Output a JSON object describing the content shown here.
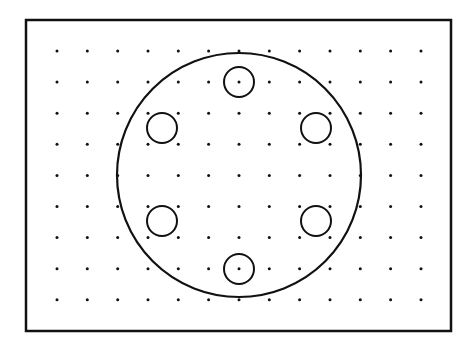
{
  "diagram": {
    "type": "bolt-circle-on-dot-grid",
    "frame": {
      "x": 26,
      "y": 20,
      "width": 425,
      "height": 311,
      "stroke": "#111111",
      "stroke_width": 2.5
    },
    "grid": {
      "columns": 13,
      "rows": 9,
      "x_start": 57,
      "x_step": 30.33,
      "y_start": 51,
      "y_step": 31.1,
      "dot_radius": 1.5,
      "dot_color": "#111111"
    },
    "main_circle": {
      "cx": 239,
      "cy": 175,
      "r": 122,
      "stroke": "#111111",
      "stroke_width": 2.2
    },
    "holes": [
      {
        "name": "hole-top",
        "cx": 239,
        "cy": 82,
        "r": 15
      },
      {
        "name": "hole-upper-left",
        "cx": 162,
        "cy": 128,
        "r": 15
      },
      {
        "name": "hole-upper-right",
        "cx": 316,
        "cy": 128,
        "r": 15
      },
      {
        "name": "hole-lower-left",
        "cx": 162,
        "cy": 221,
        "r": 15
      },
      {
        "name": "hole-lower-right",
        "cx": 316,
        "cy": 221,
        "r": 15
      },
      {
        "name": "hole-bottom",
        "cx": 239,
        "cy": 269,
        "r": 15
      }
    ],
    "hole_stroke": "#111111",
    "hole_stroke_width": 2
  }
}
